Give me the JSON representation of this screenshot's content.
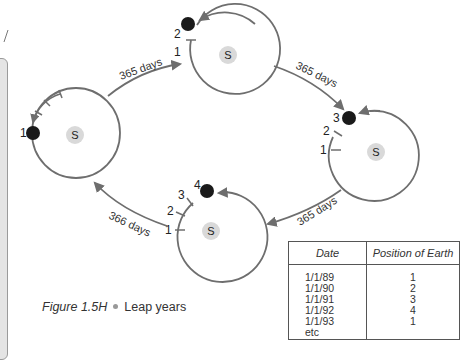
{
  "figure": {
    "number": "Figure 1.5H",
    "title": "Leap years"
  },
  "orbits": [
    {
      "id": "A",
      "sun_label": "S",
      "earth_label": "1",
      "ticks": []
    },
    {
      "id": "B",
      "sun_label": "S",
      "earth_label": "2",
      "tick_labels": [
        "1"
      ]
    },
    {
      "id": "C",
      "sun_label": "S",
      "earth_label": "3",
      "tick_labels": [
        "1",
        "2"
      ]
    },
    {
      "id": "D",
      "sun_label": "S",
      "earth_label": "4",
      "tick_labels": [
        "1",
        "2",
        "3"
      ]
    }
  ],
  "transitions": [
    {
      "from": "A",
      "to": "B",
      "label": "365 days"
    },
    {
      "from": "B",
      "to": "C",
      "label": "365 days"
    },
    {
      "from": "C",
      "to": "D",
      "label": "365 days"
    },
    {
      "from": "D",
      "to": "A",
      "label": "366 days"
    }
  ],
  "table": {
    "headers": [
      "Date",
      "Position of Earth"
    ],
    "rows": [
      {
        "date": "1/1/89",
        "position": "1"
      },
      {
        "date": "1/1/90",
        "position": "2"
      },
      {
        "date": "1/1/91",
        "position": "3"
      },
      {
        "date": "1/1/92",
        "position": "4"
      },
      {
        "date": "1/1/93",
        "position": "1"
      },
      {
        "date": "etc",
        "position": ""
      }
    ]
  },
  "colors": {
    "orbit": "#6e6e6e",
    "earth": "#1a1a1a",
    "sun": "#d9d9d9",
    "panel": "#e4e4e4"
  }
}
